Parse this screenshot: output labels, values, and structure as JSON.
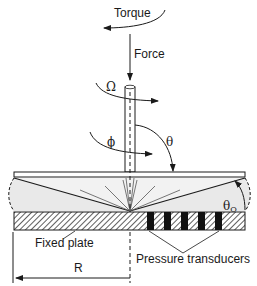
{
  "diagram": {
    "type": "cone-and-plate rheometer schematic",
    "labels": {
      "torque": "Torque",
      "force": "Force",
      "omega": "Ω",
      "phi": "ϕ",
      "theta": "θ",
      "theta_o_main": "θ",
      "theta_o_sub": "O",
      "fixed_plate": "Fixed plate",
      "pressure_transducers": "Pressure transducers",
      "radius": "R"
    },
    "transducer_count": 5,
    "colors": {
      "line": "#1a1a1a",
      "fluid_fill": "#e9e9e9",
      "background": "#ffffff",
      "transducer": "#111111"
    }
  }
}
